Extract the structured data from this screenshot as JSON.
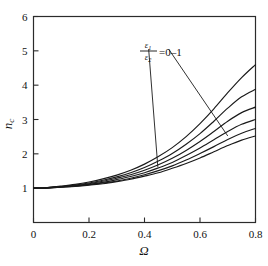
{
  "figure": {
    "background": "#ffffff",
    "line_color": "#1a1a1a",
    "axis_color": "#2b2b2b"
  },
  "axes": {
    "x": {
      "label": "Ω",
      "min": 0,
      "max": 0.8,
      "ticks": [
        0,
        0.2,
        0.4,
        0.6,
        0.8
      ],
      "tick_labels": [
        "0",
        "0.2",
        "0.4",
        "0.6",
        "0.8"
      ]
    },
    "y": {
      "label_base": "n",
      "label_sub": "c",
      "label": "n_c",
      "min": 0.0,
      "max": 6.0,
      "ticks": [
        1,
        2,
        3,
        4,
        5,
        6
      ],
      "tick_labels": [
        "1",
        "2",
        "3",
        "4",
        "5",
        "6"
      ]
    }
  },
  "annotation": {
    "numerator": "ε",
    "numerator_sub": "1",
    "denominator": "ε",
    "denominator_sub": "2",
    "equals_text": "=0–1",
    "full_text": "ε₁/ε₂ = 0–1",
    "leader_lines": [
      {
        "from_x": 0.415,
        "from_y": 5.05,
        "to_x": 0.448,
        "to_y": 1.62
      },
      {
        "from_x": 0.487,
        "from_y": 5.05,
        "to_x": 0.7,
        "to_y": 2.52
      }
    ]
  },
  "chart_data": {
    "type": "line",
    "title": "",
    "xlabel": "Ω",
    "ylabel": "n_c",
    "xlim": [
      0,
      0.8
    ],
    "ylim": [
      0,
      6
    ],
    "grid": false,
    "legend": "annotation-leader-lines",
    "x": [
      0,
      0.05,
      0.1,
      0.15,
      0.2,
      0.25,
      0.3,
      0.35,
      0.4,
      0.45,
      0.5,
      0.55,
      0.6,
      0.65,
      0.7,
      0.75,
      0.8
    ],
    "series": [
      {
        "name": "ε₁/ε₂ = 0",
        "values": [
          1.0,
          1.02,
          1.06,
          1.11,
          1.18,
          1.27,
          1.38,
          1.52,
          1.7,
          1.92,
          2.18,
          2.5,
          2.88,
          3.31,
          3.78,
          4.22,
          4.6
        ]
      },
      {
        "name": "ε₁/ε₂ = 0.2",
        "values": [
          1.0,
          1.01,
          1.05,
          1.09,
          1.15,
          1.23,
          1.33,
          1.45,
          1.6,
          1.79,
          2.01,
          2.28,
          2.59,
          2.95,
          3.33,
          3.66,
          3.88
        ]
      },
      {
        "name": "ε₁/ε₂ = 0.4",
        "values": [
          1.0,
          1.01,
          1.04,
          1.08,
          1.13,
          1.2,
          1.29,
          1.39,
          1.52,
          1.68,
          1.87,
          2.1,
          2.36,
          2.65,
          2.95,
          3.2,
          3.36
        ]
      },
      {
        "name": "ε₁/ε₂ = 0.6",
        "values": [
          1.0,
          1.01,
          1.04,
          1.07,
          1.11,
          1.17,
          1.25,
          1.34,
          1.45,
          1.59,
          1.75,
          1.95,
          2.17,
          2.41,
          2.65,
          2.86,
          3.0
        ]
      },
      {
        "name": "ε₁/ε₂ = 0.8",
        "values": [
          1.0,
          1.01,
          1.03,
          1.06,
          1.1,
          1.15,
          1.21,
          1.29,
          1.39,
          1.51,
          1.65,
          1.82,
          2.01,
          2.21,
          2.42,
          2.6,
          2.74
        ]
      },
      {
        "name": "ε₁/ε₂ = 1",
        "values": [
          1.0,
          1.01,
          1.03,
          1.05,
          1.09,
          1.13,
          1.19,
          1.26,
          1.35,
          1.45,
          1.58,
          1.72,
          1.88,
          2.06,
          2.24,
          2.4,
          2.52
        ]
      }
    ]
  }
}
